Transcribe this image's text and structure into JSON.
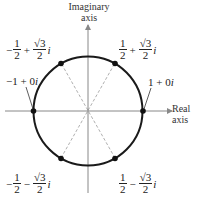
{
  "diagram": {
    "type": "complex-plane-unit-circle",
    "axes": {
      "vertical_title_line1": "Imaginary",
      "vertical_title_line2": "axis",
      "horizontal_title_line1": "Real",
      "horizontal_title_line2": "axis"
    },
    "colors": {
      "circle": "#1a1a1a",
      "axis": "#888888",
      "dashed": "#aaaaaa",
      "point": "#111111"
    },
    "points": [
      {
        "id": "p0",
        "label": "1 + 0i",
        "real": "1",
        "imag": "0",
        "angle_deg": 0
      },
      {
        "id": "p60",
        "real_sign": "",
        "real_num": "1",
        "real_den": "2",
        "op": "+",
        "imag_num": "√3",
        "imag_den": "2",
        "unit": "i",
        "angle_deg": 60
      },
      {
        "id": "p120",
        "real_sign": "−",
        "real_num": "1",
        "real_den": "2",
        "op": "+",
        "imag_num": "√3",
        "imag_den": "2",
        "unit": "i",
        "angle_deg": 120
      },
      {
        "id": "p180",
        "label": "−1 + 0i",
        "real": "-1",
        "imag": "0",
        "angle_deg": 180
      },
      {
        "id": "p240",
        "real_sign": "−",
        "real_num": "1",
        "real_den": "2",
        "op": "−",
        "imag_num": "√3",
        "imag_den": "2",
        "unit": "i",
        "angle_deg": 240
      },
      {
        "id": "p300",
        "real_sign": "",
        "real_num": "1",
        "real_den": "2",
        "op": "−",
        "imag_num": "√3",
        "imag_den": "2",
        "unit": "i",
        "angle_deg": 300
      }
    ],
    "labels": {
      "one_plus_zero_i": {
        "pre": "1 + 0",
        "unit": "i"
      },
      "neg_one_plus_zero_i": {
        "pre": "−1 + 0",
        "unit": "i"
      }
    }
  }
}
